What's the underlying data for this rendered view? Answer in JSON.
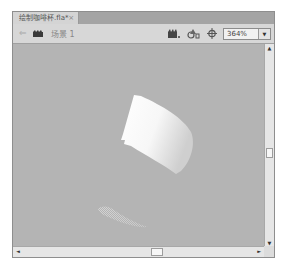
{
  "document_tab": {
    "title": "绘制咖啡杯.fla*",
    "close_glyph": "×"
  },
  "scene_bar": {
    "back_icon": "back-arrow-icon",
    "scene_icon": "clapperboard-icon",
    "scene_label": "场景 1",
    "edit_scene_icon": "edit-scene-icon",
    "edit_symbol_icon": "edit-symbol-icon",
    "center_stage_icon": "center-stage-icon",
    "zoom": {
      "value": "364%",
      "dropdown_glyph": "▼"
    }
  },
  "canvas": {
    "background": "#b4b4b4",
    "shapes": [
      {
        "name": "cup-body",
        "fill": "white-to-gray gradient"
      },
      {
        "name": "cup-reflection",
        "fill": "dithered white-to-transparent gradient"
      }
    ]
  },
  "scrollbars": {
    "up_glyph": "▲",
    "down_glyph": "▼",
    "left_glyph": "◄",
    "right_glyph": "►"
  }
}
